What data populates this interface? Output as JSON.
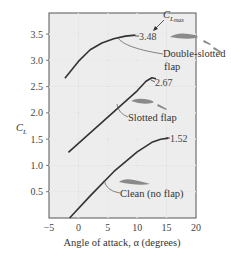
{
  "chart_data": {
    "type": "line",
    "title": "",
    "xlabel": "Angle of attack, α (degrees)",
    "ylabel": "C_L",
    "xlim": [
      -5,
      20
    ],
    "ylim": [
      0,
      3.8
    ],
    "xticks": [
      -5,
      0,
      5,
      10,
      15,
      20
    ],
    "yticks": [
      0.5,
      1.0,
      1.5,
      2.0,
      2.5,
      3.0,
      3.5
    ],
    "xtick_labels": [
      "−5",
      "0",
      "5",
      "10",
      "15",
      "20"
    ],
    "ytick_labels": [
      "0.5",
      "1.0",
      "1.5",
      "2.0",
      "2.5",
      "3.0",
      "3.5"
    ],
    "grid": true,
    "series": [
      {
        "name": "Double-slotted flap",
        "x": [
          -2.3,
          0,
          2,
          4,
          6,
          8,
          9.7
        ],
        "y": [
          2.66,
          2.98,
          3.2,
          3.33,
          3.41,
          3.46,
          3.48
        ],
        "max_label": "3.48"
      },
      {
        "name": "Slotted flap",
        "x": [
          -1.7,
          2,
          6,
          10,
          11.5,
          12.5,
          13.2
        ],
        "y": [
          1.25,
          1.62,
          2.02,
          2.42,
          2.6,
          2.67,
          2.65
        ],
        "max_label": "2.67"
      },
      {
        "name": "Clean (no flap)",
        "x": [
          -1.5,
          2,
          6,
          10,
          12.5,
          14,
          15.3
        ],
        "y": [
          0.0,
          0.42,
          0.88,
          1.26,
          1.44,
          1.5,
          1.52
        ],
        "max_label": "1.52"
      }
    ],
    "annotations": [
      {
        "text": "C",
        "sub": "L max",
        "note": "arrow pointing to maximum value"
      },
      {
        "text": "Double-slotted",
        "line2": "flap"
      },
      {
        "text": "Slotted flap"
      },
      {
        "text": "Clean (no flap)"
      }
    ]
  },
  "labels": {
    "ylabel_main": "C",
    "ylabel_sub": "L",
    "xlabel": "Angle of attack, α (degrees)",
    "clmax_main": "C",
    "clmax_sub": "L",
    "clmax_subsub": "max",
    "double_slotted_1": "Double-slotted",
    "double_slotted_2": "flap",
    "slotted": "Slotted flap",
    "clean": "Clean (no flap)",
    "max_double": "3.48",
    "max_slotted": "2.67",
    "max_clean": "1.52"
  },
  "colors": {
    "background": "#ffffff",
    "plot_bg": "#ededed",
    "grid": "#ffffff",
    "frame": "#555555",
    "curve": "#333333",
    "airfoil": "#8a8a8a"
  }
}
